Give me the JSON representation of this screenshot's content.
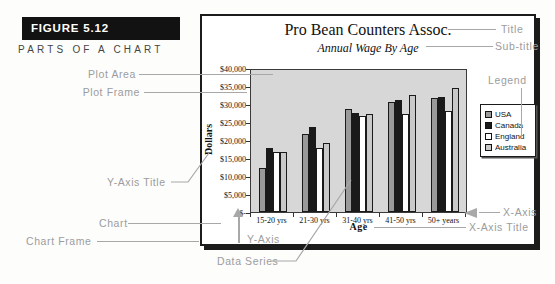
{
  "figure": {
    "label": "FIGURE 5.12",
    "caption": "PARTS OF A CHART"
  },
  "callouts": {
    "plot_area": "Plot Area",
    "plot_frame": "Plot Frame",
    "y_axis_title": "Y-Axis Title",
    "chart": "Chart",
    "chart_frame": "Chart Frame",
    "y_axis": "Y-Axis",
    "data_series": "Data Series",
    "title": "Title",
    "sub_title": "Sub-title",
    "legend": "Legend",
    "x_axis": "X-Axis",
    "x_axis_title": "X-Axis Title"
  },
  "chart_data": {
    "type": "bar",
    "title": "Pro Bean Counters Assoc.",
    "subtitle": "Annual Wage By Age",
    "xlabel": "Age",
    "ylabel": "Dollars",
    "categories": [
      "15-20 yrs",
      "21-30 yrs",
      "31-40 yrs",
      "41-50 yrs",
      "50+ years"
    ],
    "series": [
      {
        "name": "USA",
        "color": "#9a9a9a",
        "values": [
          12500,
          22000,
          29000,
          31000,
          32000
        ]
      },
      {
        "name": "Canada",
        "color": "#1a1a1a",
        "values": [
          18000,
          24000,
          28000,
          31500,
          32500
        ]
      },
      {
        "name": "England",
        "color": "#ffffff",
        "values": [
          17000,
          18000,
          27000,
          27500,
          28500
        ]
      },
      {
        "name": "Australia",
        "color": "#c9c9c9",
        "values": [
          17000,
          19500,
          27500,
          33000,
          35000
        ]
      }
    ],
    "y_ticks": [
      "$40,000",
      "$35,000",
      "$30,000",
      "$25,000",
      "$20,000",
      "$15,000",
      "$10,000",
      "$5,000",
      "$-"
    ],
    "ylim": [
      0,
      40000
    ],
    "grid": false,
    "legend_position": "right"
  }
}
